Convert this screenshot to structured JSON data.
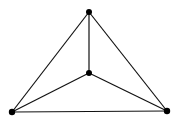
{
  "diagram": {
    "type": "graph",
    "colors": {
      "edge": "#111111",
      "vertex": "#000000",
      "background": "#ffffff"
    },
    "vertices": [
      {
        "id": "top",
        "x": 89,
        "y": 12,
        "r": 3
      },
      {
        "id": "center",
        "x": 89,
        "y": 73,
        "r": 3
      },
      {
        "id": "bottom-left",
        "x": 12,
        "y": 112,
        "r": 3.2
      },
      {
        "id": "bottom-right",
        "x": 167,
        "y": 111,
        "r": 3.2
      }
    ],
    "edges": [
      {
        "from": "top",
        "to": "bottom-left"
      },
      {
        "from": "top",
        "to": "bottom-right"
      },
      {
        "from": "bottom-left",
        "to": "bottom-right"
      },
      {
        "from": "top",
        "to": "center"
      },
      {
        "from": "center",
        "to": "bottom-left"
      },
      {
        "from": "center",
        "to": "bottom-right"
      }
    ]
  }
}
